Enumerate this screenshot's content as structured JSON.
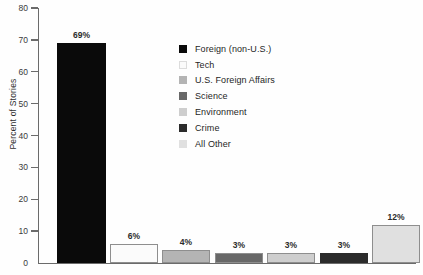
{
  "chart_data": {
    "type": "bar",
    "title": "",
    "xlabel": "",
    "ylabel": "Percent of Stories",
    "ylim": [
      0,
      80
    ],
    "yticks": [
      0,
      10,
      20,
      30,
      40,
      50,
      60,
      70,
      80
    ],
    "grid": false,
    "legend_position": "inside-upper-center",
    "categories": [
      "Foreign (non-U.S.)",
      "Tech",
      "U.S. Foreign Affairs",
      "Science",
      "Environment",
      "Crime",
      "All Other"
    ],
    "values": [
      69,
      6,
      4,
      3,
      3,
      3,
      12
    ],
    "value_labels": [
      "69%",
      "6%",
      "4%",
      "3%",
      "3%",
      "3%",
      "12%"
    ],
    "colors": [
      "#0a0a0a",
      "#fbfbfb",
      "#b4b4b4",
      "#686868",
      "#cecece",
      "#2b2b2b",
      "#e0e0e0"
    ]
  },
  "legend": {
    "items": [
      {
        "label": "Foreign (non-U.S.)",
        "color": "#0a0a0a"
      },
      {
        "label": "Tech",
        "color": "#fbfbfb"
      },
      {
        "label": "U.S. Foreign Affairs",
        "color": "#b4b4b4"
      },
      {
        "label": "Science",
        "color": "#686868"
      },
      {
        "label": "Environment",
        "color": "#cecece"
      },
      {
        "label": "Crime",
        "color": "#2b2b2b"
      },
      {
        "label": "All Other",
        "color": "#e0e0e0"
      }
    ]
  },
  "axis": {
    "y_title": "Percent of Stories",
    "y_ticks": [
      "80",
      "70",
      "60",
      "50",
      "40",
      "30",
      "20",
      "10",
      "0"
    ]
  }
}
